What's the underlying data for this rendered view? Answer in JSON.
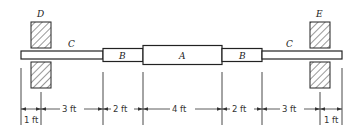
{
  "diagram": {
    "type": "stepped-shaft",
    "labels": {
      "left_support": "D",
      "right_support": "E",
      "left_shaft": "C",
      "right_shaft": "C",
      "left_mid": "B",
      "right_mid": "B",
      "center": "A"
    },
    "dimensions": [
      "1 ft",
      "3 ft",
      "2 ft",
      "4 ft",
      "2 ft",
      "3 ft",
      "1 ft"
    ],
    "colors": {
      "line": "#222222",
      "background": "#ffffff"
    }
  }
}
